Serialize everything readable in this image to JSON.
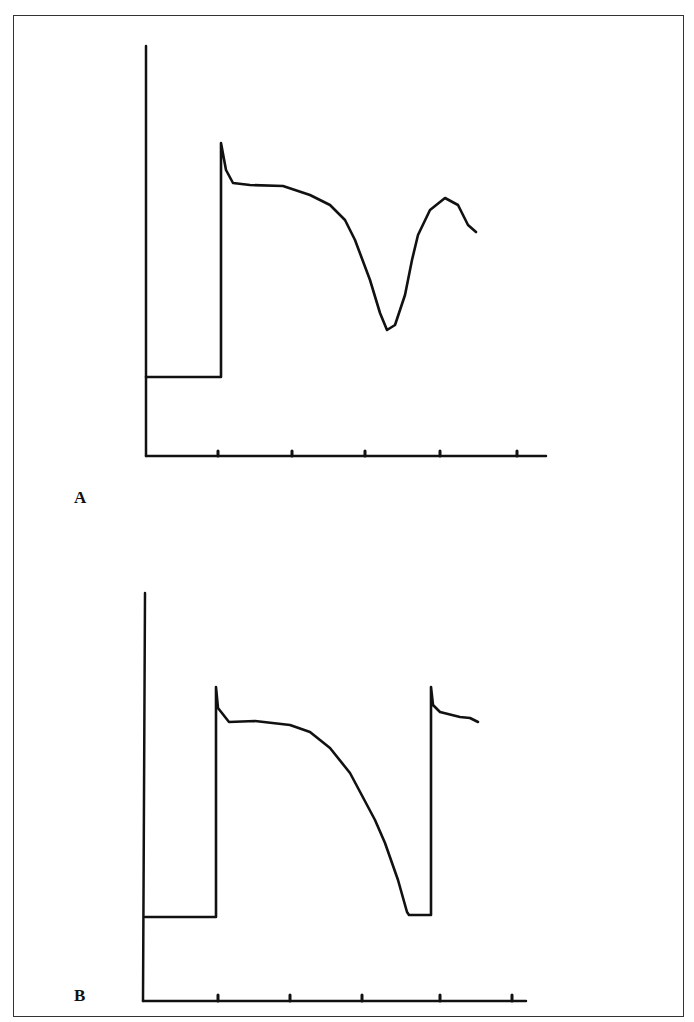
{
  "figure": {
    "panels": [
      {
        "label": "A",
        "description": "Action potential with early afterdepolarization-like notch during repolarization"
      },
      {
        "label": "B",
        "description": "Action potential followed by next upstroke"
      }
    ]
  },
  "colors": {
    "line": "#111111",
    "background": "#ffffff",
    "frame": "#333333"
  },
  "chart_data": [
    {
      "type": "line",
      "title": "A",
      "xlabel": "",
      "ylabel": "",
      "x_ticks": 5,
      "tick_labels": [],
      "grid": false,
      "points_px": [
        [
          146,
          377
        ],
        [
          221,
          377
        ],
        [
          221,
          143
        ],
        [
          226,
          170
        ],
        [
          233,
          183
        ],
        [
          250,
          185
        ],
        [
          283,
          186
        ],
        [
          310,
          195
        ],
        [
          330,
          205
        ],
        [
          345,
          220
        ],
        [
          355,
          240
        ],
        [
          370,
          280
        ],
        [
          380,
          313
        ],
        [
          387,
          330
        ],
        [
          395,
          325
        ],
        [
          405,
          295
        ],
        [
          412,
          260
        ],
        [
          418,
          235
        ],
        [
          430,
          210
        ],
        [
          445,
          198
        ],
        [
          458,
          205
        ],
        [
          468,
          225
        ],
        [
          476,
          232
        ]
      ]
    },
    {
      "type": "line",
      "title": "B",
      "xlabel": "",
      "ylabel": "",
      "x_ticks": 5,
      "tick_labels": [],
      "grid": false,
      "points_px": [
        [
          145,
          917
        ],
        [
          216,
          917
        ],
        [
          216,
          687
        ],
        [
          218,
          708
        ],
        [
          229,
          722
        ],
        [
          255,
          721
        ],
        [
          290,
          725
        ],
        [
          310,
          732
        ],
        [
          330,
          748
        ],
        [
          350,
          773
        ],
        [
          375,
          820
        ],
        [
          385,
          843
        ],
        [
          398,
          880
        ],
        [
          407,
          912
        ],
        [
          409,
          915
        ],
        [
          431,
          915
        ],
        [
          431,
          687
        ],
        [
          433,
          705
        ],
        [
          440,
          712
        ],
        [
          460,
          717
        ],
        [
          470,
          718
        ],
        [
          478,
          722
        ]
      ]
    }
  ]
}
